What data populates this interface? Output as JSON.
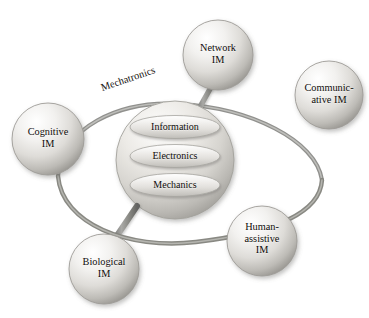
{
  "diagram": {
    "title": "Mechatronics",
    "background_color": "#ffffff",
    "text_color": "#100d0b",
    "sphere_fill_light": "#fbfbfa",
    "sphere_fill_mid": "#d9d8d4",
    "sphere_fill_dark": "#9e9c98",
    "connector_color": "#8a8a88",
    "ring_color": "#8d8d8b",
    "core": {
      "name": "core-sphere",
      "layers": [
        {
          "id": "information",
          "label": "Information"
        },
        {
          "id": "electronics",
          "label": "Electronics"
        },
        {
          "id": "mechanics",
          "label": "Mechanics"
        }
      ]
    },
    "satellites": [
      {
        "id": "network-im",
        "label": "Network\nIM",
        "cx": 218,
        "cy": 55,
        "r": 35
      },
      {
        "id": "communicative-im",
        "label": "Communic-\native IM",
        "cx": 329,
        "cy": 95,
        "r": 34
      },
      {
        "id": "cognitive-im",
        "label": "Cognitive\nIM",
        "cx": 48,
        "cy": 139,
        "r": 36
      },
      {
        "id": "human-assistive-im",
        "label": "Human-\nassistive\nIM",
        "cx": 262,
        "cy": 241,
        "r": 35
      },
      {
        "id": "biological-im",
        "label": "Biological\nIM",
        "cx": 104,
        "cy": 269,
        "r": 35
      }
    ],
    "connectors": [
      {
        "id": "network-stem",
        "from": "network-im",
        "to": "core-sphere"
      },
      {
        "id": "biological-stem",
        "from": "biological-im",
        "to": "core-sphere"
      },
      {
        "id": "cognitive-ring-link",
        "from": "cognitive-im",
        "to": "orbit-ring"
      },
      {
        "id": "human-assistive-ring-link",
        "from": "human-assistive-im",
        "to": "orbit-ring"
      }
    ],
    "ring": {
      "id": "orbit-ring",
      "label": "Mechatronics"
    }
  }
}
